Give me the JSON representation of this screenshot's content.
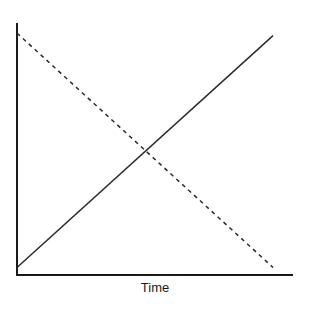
{
  "chart_data": {
    "type": "line",
    "title": "",
    "xlabel": "Time",
    "ylabel": "",
    "x": [
      0,
      1
    ],
    "series": [
      {
        "name": "increasing",
        "style": "solid",
        "color": "#2a2a2a",
        "values": [
          0.03,
          0.95
        ]
      },
      {
        "name": "decreasing",
        "style": "dashed",
        "color": "#2a2a2a",
        "values": [
          0.96,
          0.03
        ]
      }
    ],
    "xlim": [
      0,
      1.08
    ],
    "ylim": [
      0,
      1
    ],
    "grid": false,
    "legend": null,
    "ticks": {
      "x": [],
      "y": []
    }
  },
  "colors": {
    "axis": "#1a1a1a",
    "line": "#2a2a2a",
    "background": "#ffffff"
  }
}
